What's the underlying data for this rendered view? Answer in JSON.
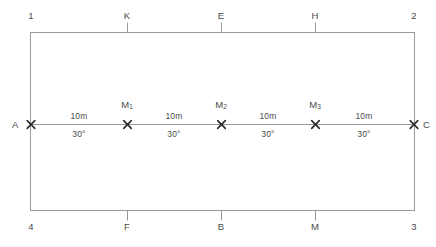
{
  "diagram": {
    "type": "survey-traverse-rectangle",
    "shape": {
      "name": "rectangle",
      "corners": [
        {
          "label": "1",
          "position": "top-left"
        },
        {
          "label": "2",
          "position": "top-right"
        },
        {
          "label": "3",
          "position": "bottom-right"
        },
        {
          "label": "4",
          "position": "bottom-left"
        }
      ]
    },
    "top_edge_points": [
      {
        "label": "K"
      },
      {
        "label": "E"
      },
      {
        "label": "H"
      }
    ],
    "bottom_edge_points": [
      {
        "label": "F"
      },
      {
        "label": "B"
      },
      {
        "label": "M"
      }
    ],
    "centerline": {
      "start_label": "A",
      "end_label": "C",
      "stations": [
        {
          "label": "M",
          "subscript": "1"
        },
        {
          "label": "M",
          "subscript": "2"
        },
        {
          "label": "M",
          "subscript": "3"
        }
      ],
      "segments": [
        {
          "distance": "10m",
          "angle": "30°"
        },
        {
          "distance": "10m",
          "angle": "30°"
        },
        {
          "distance": "10m",
          "angle": "30°"
        },
        {
          "distance": "10m",
          "angle": "30°"
        }
      ]
    },
    "colors": {
      "line": "#9a9a9a",
      "marker": "#2b2b2b",
      "text": "#4a4a4a",
      "background": "#ffffff"
    }
  }
}
